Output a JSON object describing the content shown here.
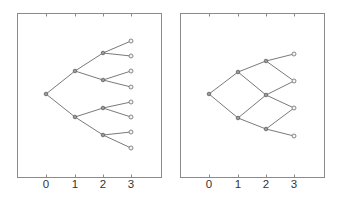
{
  "figure": {
    "panels": [
      {
        "name": "binary-tree",
        "frame": {
          "x0": 17,
          "y0": 13,
          "x1": 161,
          "y1": 177
        },
        "x_ticks": [
          {
            "label": "0",
            "x": 46
          },
          {
            "label": "1",
            "x": 75
          },
          {
            "label": "2",
            "x": 103
          },
          {
            "label": "3",
            "x": 131
          }
        ],
        "nodes": [
          {
            "id": "r",
            "x": 46,
            "y": 94,
            "level": 0
          },
          {
            "id": "u",
            "x": 75,
            "y": 71,
            "level": 1
          },
          {
            "id": "d",
            "x": 75,
            "y": 117,
            "level": 1
          },
          {
            "id": "uu",
            "x": 103,
            "y": 53,
            "level": 2
          },
          {
            "id": "ud",
            "x": 103,
            "y": 80,
            "level": 2
          },
          {
            "id": "du",
            "x": 103,
            "y": 108,
            "level": 2
          },
          {
            "id": "dd",
            "x": 103,
            "y": 135,
            "level": 2
          },
          {
            "id": "uuu",
            "x": 131,
            "y": 41,
            "level": 3
          },
          {
            "id": "uud",
            "x": 131,
            "y": 56,
            "level": 3
          },
          {
            "id": "udu",
            "x": 131,
            "y": 71,
            "level": 3
          },
          {
            "id": "udd",
            "x": 131,
            "y": 87,
            "level": 3
          },
          {
            "id": "duu",
            "x": 131,
            "y": 102,
            "level": 3
          },
          {
            "id": "dud",
            "x": 131,
            "y": 117,
            "level": 3
          },
          {
            "id": "ddu",
            "x": 131,
            "y": 132,
            "level": 3
          },
          {
            "id": "ddd",
            "x": 131,
            "y": 148,
            "level": 3
          }
        ],
        "edges": [
          [
            "r",
            "u"
          ],
          [
            "r",
            "d"
          ],
          [
            "u",
            "uu"
          ],
          [
            "u",
            "ud"
          ],
          [
            "d",
            "du"
          ],
          [
            "d",
            "dd"
          ],
          [
            "uu",
            "uuu"
          ],
          [
            "uu",
            "uud"
          ],
          [
            "ud",
            "udu"
          ],
          [
            "ud",
            "udd"
          ],
          [
            "du",
            "duu"
          ],
          [
            "du",
            "dud"
          ],
          [
            "dd",
            "ddu"
          ],
          [
            "dd",
            "ddd"
          ]
        ]
      },
      {
        "name": "recombining-lattice",
        "frame": {
          "x0": 180,
          "y0": 13,
          "x1": 324,
          "y1": 177
        },
        "x_ticks": [
          {
            "label": "0",
            "x": 209
          },
          {
            "label": "1",
            "x": 238
          },
          {
            "label": "2",
            "x": 266
          },
          {
            "label": "3",
            "x": 294
          }
        ],
        "nodes": [
          {
            "id": "r",
            "x": 209,
            "y": 94,
            "level": 0
          },
          {
            "id": "u",
            "x": 238,
            "y": 72,
            "level": 1
          },
          {
            "id": "d",
            "x": 238,
            "y": 118,
            "level": 1
          },
          {
            "id": "uu",
            "x": 266,
            "y": 61,
            "level": 2
          },
          {
            "id": "ud",
            "x": 266,
            "y": 95,
            "level": 2
          },
          {
            "id": "dd",
            "x": 266,
            "y": 129,
            "level": 2
          },
          {
            "id": "uuu",
            "x": 294,
            "y": 54,
            "level": 3
          },
          {
            "id": "uud",
            "x": 294,
            "y": 81,
            "level": 3
          },
          {
            "id": "udd",
            "x": 294,
            "y": 108,
            "level": 3
          },
          {
            "id": "ddd",
            "x": 294,
            "y": 136,
            "level": 3
          }
        ],
        "edges": [
          [
            "r",
            "u"
          ],
          [
            "r",
            "d"
          ],
          [
            "u",
            "uu"
          ],
          [
            "u",
            "ud"
          ],
          [
            "d",
            "ud"
          ],
          [
            "d",
            "dd"
          ],
          [
            "uu",
            "uuu"
          ],
          [
            "uu",
            "uud"
          ],
          [
            "ud",
            "uud"
          ],
          [
            "ud",
            "udd"
          ],
          [
            "dd",
            "udd"
          ],
          [
            "dd",
            "ddd"
          ]
        ]
      }
    ],
    "tick_label_y": 184,
    "colors": {
      "frame": "#8a8a8a",
      "edge": "#7a7a7a",
      "label": "#333333"
    }
  }
}
